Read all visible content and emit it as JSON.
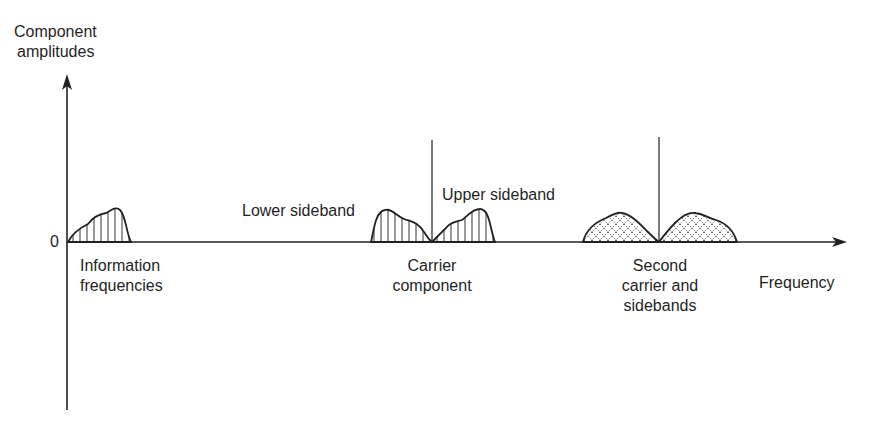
{
  "axes": {
    "y_label_line1": "Component",
    "y_label_line2": "amplitudes",
    "x_label": "Frequency",
    "origin_label": "0"
  },
  "labels": {
    "information_line1": "Information",
    "information_line2": "frequencies",
    "lower_sideband": "Lower sideband",
    "upper_sideband": "Upper sideband",
    "carrier_line1": "Carrier",
    "carrier_line2": "component",
    "second_line1": "Second",
    "second_line2": "carrier and",
    "second_line3": "sidebands"
  },
  "colors": {
    "ink": "#1f1f1f",
    "background": "#ffffff"
  }
}
